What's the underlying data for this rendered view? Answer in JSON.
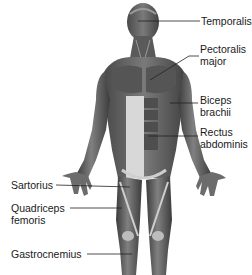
{
  "diagram": {
    "colors": {
      "muscle_dark": "#3a3a3a",
      "muscle_mid": "#6a6a6a",
      "tendon": "#d9d9d9",
      "leader": "#222222",
      "text": "#1a1a1a"
    },
    "labels": [
      {
        "id": "temporalis",
        "lines": [
          "Temporalis"
        ],
        "side": "right"
      },
      {
        "id": "pectoralis-major",
        "lines": [
          "Pectoralis",
          "major"
        ],
        "side": "right"
      },
      {
        "id": "biceps-brachii",
        "lines": [
          "Biceps",
          "brachii"
        ],
        "side": "right"
      },
      {
        "id": "rectus-abdominis",
        "lines": [
          "Rectus",
          "abdominis"
        ],
        "side": "right"
      },
      {
        "id": "sartorius",
        "lines": [
          "Sartorius"
        ],
        "side": "left"
      },
      {
        "id": "quadriceps-femoris",
        "lines": [
          "Quadriceps",
          "femoris"
        ],
        "side": "left"
      },
      {
        "id": "gastrocnemius",
        "lines": [
          "Gastrocnemius"
        ],
        "side": "left"
      }
    ]
  }
}
